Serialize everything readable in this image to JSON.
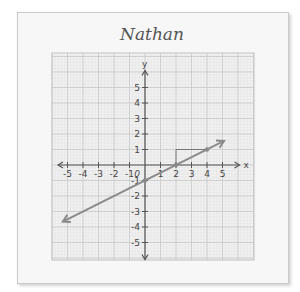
{
  "card": {
    "title": "Nathan"
  },
  "chart_data": {
    "type": "line",
    "title": "Nathan",
    "xlabel": "x",
    "ylabel": "y",
    "xlim": [
      -5,
      5
    ],
    "ylim": [
      -5,
      5
    ],
    "grid": true,
    "x_ticks": [
      "-5",
      "-4",
      "-3",
      "-2",
      "-1",
      "0",
      "1",
      "2",
      "3",
      "4",
      "5"
    ],
    "y_ticks": [
      "5",
      "4",
      "3",
      "2",
      "1",
      "-1",
      "-2",
      "-3",
      "-4",
      "-5"
    ],
    "series": [
      {
        "name": "line",
        "equation": "y = 0.5x - 1",
        "slope": 0.5,
        "intercept": -1,
        "points": [
          [
            -5.3,
            -3.65
          ],
          [
            0,
            -1
          ],
          [
            2,
            0
          ],
          [
            4,
            1
          ],
          [
            5.1,
            1.55
          ]
        ]
      }
    ],
    "slope_triangle": {
      "rise_from": [
        2,
        0
      ],
      "corner": [
        2,
        1
      ],
      "run_to": [
        4,
        1
      ],
      "rise": 1,
      "run": 2
    },
    "marked_points": [
      [
        0,
        -1
      ],
      [
        2,
        0
      ],
      [
        4,
        1
      ]
    ],
    "colors": {
      "line": "#8a8a8a",
      "axis": "#555555",
      "grid": "#c8c8c8"
    }
  }
}
